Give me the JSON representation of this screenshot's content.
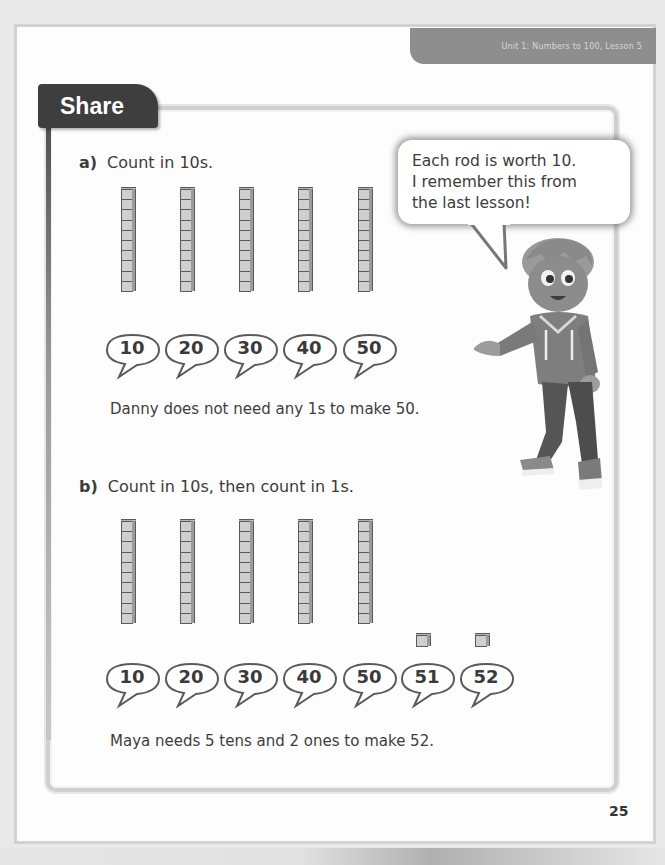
{
  "header": {
    "unit_label": "Unit 1: Numbers to 100, Lesson 5",
    "section_title": "Share"
  },
  "part_a": {
    "letter": "a)",
    "instruction": "Count in 10s.",
    "rods": 5,
    "counts": [
      "10",
      "20",
      "30",
      "40",
      "50"
    ],
    "conclusion": "Danny does not need any 1s to make 50."
  },
  "part_b": {
    "letter": "b)",
    "instruction": "Count in 10s, then count in 1s.",
    "rods": 5,
    "ones": 2,
    "counts": [
      "10",
      "20",
      "30",
      "40",
      "50",
      "51",
      "52"
    ],
    "conclusion": "Maya needs 5 tens and 2 ones to make 52."
  },
  "speech_bubble": {
    "lines": [
      "Each rod is worth 10.",
      "I remember this from",
      "the last lesson!"
    ]
  },
  "character": {
    "icon": "boy-character-illustration"
  },
  "footer": {
    "page_number": "25"
  },
  "colors": {
    "tab_dark": "#3e3e3e",
    "unit_tab": "#8e8e8e",
    "cube_fill": "#cfcfcf",
    "text": "#3a3a3a"
  }
}
